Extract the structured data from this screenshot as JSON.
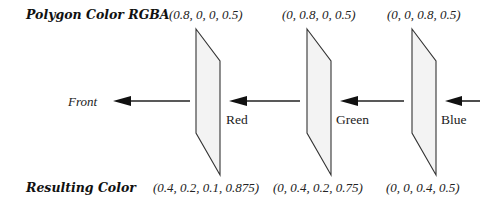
{
  "row_labels": {
    "polygon_color": "Polygon Color RGBA",
    "resulting_color": "Resulting Color"
  },
  "front_label": "Front",
  "polygons": [
    {
      "name": "Red",
      "rgba": "(0.8, 0, 0, 0.5)",
      "result": "(0.4, 0.2, 0.1, 0.875)"
    },
    {
      "name": "Green",
      "rgba": "(0, 0.8, 0, 0.5)",
      "result": "(0, 0.4, 0.2, 0.75)"
    },
    {
      "name": "Blue",
      "rgba": "(0, 0, 0.8, 0.5)",
      "result": "(0, 0, 0.4, 0.5)"
    }
  ],
  "colors": {
    "polygon_fill": "#f3f3f3",
    "stroke": "#333333",
    "arrow": "#111111"
  }
}
